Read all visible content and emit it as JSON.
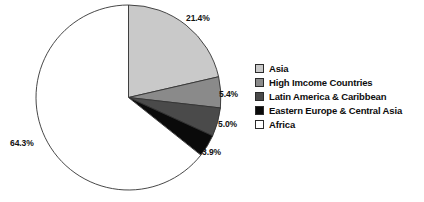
{
  "chart_data": {
    "type": "pie",
    "title": "",
    "subtitle": "",
    "xlabel": "",
    "ylabel": "",
    "legend_position": "right",
    "grid": false,
    "start_angle_deg": 0,
    "direction": "clockwise",
    "categories": [
      "Asia",
      "High Imcome Countries",
      "Latin America & Caribbean",
      "Eastern Europe & Central Asia",
      "Africa"
    ],
    "values": [
      21.4,
      5.4,
      5.0,
      3.9,
      64.3
    ],
    "value_labels": [
      "21.4%",
      "5.4%",
      "5.0%",
      "3.9%",
      "64.3%"
    ],
    "colors": [
      "#c9c9c9",
      "#8a8a8a",
      "#4a4a4a",
      "#0a0a0a",
      "#ffffff"
    ],
    "slice_outline_color": "#333333",
    "units": "percent"
  },
  "legend": {
    "items": [
      {
        "label": "Asia",
        "color": "#c9c9c9"
      },
      {
        "label": "High Imcome Countries",
        "color": "#8a8a8a"
      },
      {
        "label": "Latin America & Caribbean",
        "color": "#4a4a4a"
      },
      {
        "label": "Eastern Europe & Central Asia",
        "color": "#0a0a0a"
      },
      {
        "label": "Africa",
        "color": "#ffffff"
      }
    ]
  },
  "labels": {
    "asia_pct": "21.4%",
    "high_income_pct": "5.4%",
    "latin_america_pct": "5.0%",
    "eastern_europe_pct": "3.9%",
    "africa_pct": "64.3%"
  }
}
